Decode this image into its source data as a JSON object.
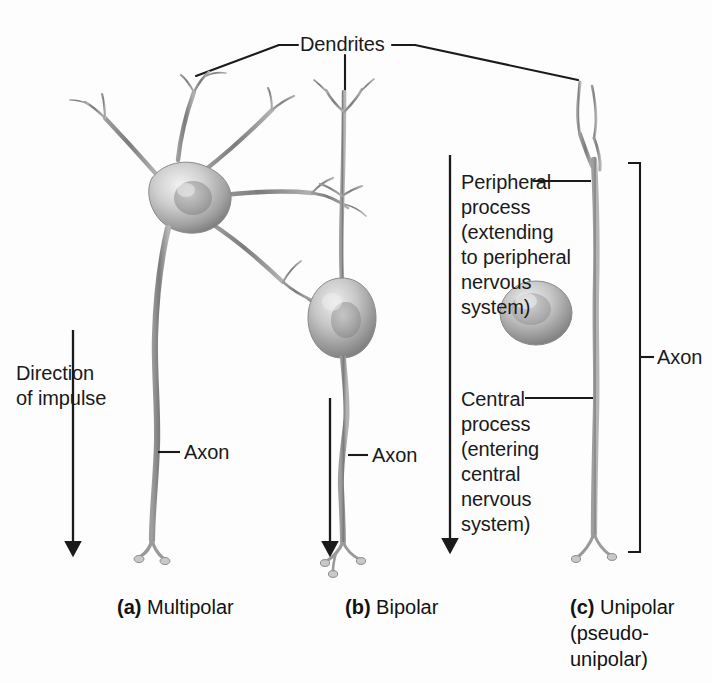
{
  "figure": {
    "background": "#fdfdfd",
    "ink": "#1a1a1a",
    "cell_fill": "#b9b9b9",
    "cell_shadow": "#6f6f6f",
    "process_color": "#8e8e8e"
  },
  "labels": {
    "dendrites": "Dendrites",
    "direction_of_impulse": "Direction\nof impulse",
    "axon_multipolar": "Axon",
    "axon_bipolar": "Axon",
    "axon_unipolar": "Axon",
    "peripheral_process": "Peripheral process (extending to peripheral nervous system)",
    "peripheral_process_lines": [
      "Peripheral",
      "process",
      "(extending",
      "to peripheral",
      "nervous",
      "system)"
    ],
    "central_process": "Central process (entering central nervous system)",
    "central_process_lines": [
      "Central",
      "process",
      "(entering",
      "central",
      "nervous",
      "system)"
    ]
  },
  "captions": [
    {
      "letter": "(a)",
      "name": "Multipolar",
      "extra": ""
    },
    {
      "letter": "(b)",
      "name": "Bipolar",
      "extra": ""
    },
    {
      "letter": "(c)",
      "name": "Unipolar",
      "extra": "(pseudo-unipolar)"
    }
  ],
  "neurons": [
    {
      "type": "multipolar",
      "soma_shape": "stellate",
      "dendrite_count": 5,
      "axon": "single long branching axon"
    },
    {
      "type": "bipolar",
      "soma_shape": "ovoid-spindle",
      "dendrite_count": 1,
      "axon": "single long axon"
    },
    {
      "type": "unipolar",
      "soma_shape": "round",
      "dendrite_count": 1,
      "axon": "single axon with peripheral and central process"
    }
  ],
  "icons": {
    "impulse_arrow": "down-arrow-icon",
    "bracket": "axon-bracket-icon",
    "leader": "leader-line-icon"
  }
}
